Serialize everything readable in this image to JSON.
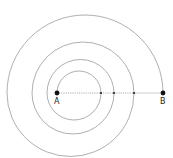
{
  "diagram": {
    "type": "spiral-of-semicircles",
    "points": {
      "A": {
        "label": "A",
        "x": 57,
        "y": 93
      },
      "B": {
        "label": "B",
        "x": 163,
        "y": 93
      }
    },
    "intermediate_dots": [
      {
        "x": 101,
        "y": 93
      },
      {
        "x": 114,
        "y": 93
      },
      {
        "x": 134,
        "y": 93
      }
    ],
    "arcs": [
      {
        "from_x": 57,
        "to_x": 101,
        "side": "top"
      },
      {
        "from_x": 101,
        "to_x": 47,
        "side": "bottom"
      },
      {
        "from_x": 47,
        "to_x": 114,
        "side": "top"
      },
      {
        "from_x": 114,
        "to_x": 32,
        "side": "bottom"
      },
      {
        "from_x": 32,
        "to_x": 134,
        "side": "top"
      },
      {
        "from_x": 134,
        "to_x": 7,
        "side": "bottom"
      },
      {
        "from_x": 7,
        "to_x": 163,
        "side": "top"
      }
    ],
    "colors": {
      "arc": "#9a9a9a",
      "dotted_line": "#8a8a8a",
      "solid_line": "#c8c8c8",
      "point": "#111111"
    }
  }
}
